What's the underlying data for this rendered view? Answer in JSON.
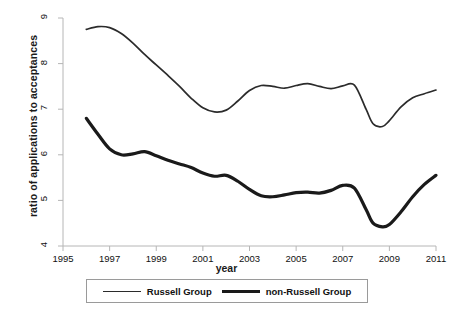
{
  "chart_data": {
    "type": "line",
    "title": "",
    "xlabel": "year",
    "ylabel": "ratio of applications to acceptances",
    "xlim": [
      1995,
      2011
    ],
    "ylim": [
      4,
      9
    ],
    "xticks": [
      "1995",
      "1997",
      "1999",
      "2001",
      "2003",
      "2005",
      "2007",
      "2009",
      "2011"
    ],
    "yticks": [
      "4",
      "5",
      "6",
      "7",
      "8",
      "9"
    ],
    "grid": false,
    "legend_position": "bottom-center",
    "series": [
      {
        "name": "Russell Group",
        "color": "#2b2b2b",
        "line_width": 1.7,
        "x": [
          1996.0,
          1996.5,
          1997.0,
          1997.5,
          1998.0,
          1998.5,
          1999.0,
          1999.5,
          2000.0,
          2000.5,
          2001.0,
          2001.5,
          2002.0,
          2002.5,
          2003.0,
          2003.5,
          2004.0,
          2004.5,
          2005.0,
          2005.5,
          2006.0,
          2006.5,
          2007.0,
          2007.5,
          2008.0,
          2008.3,
          2008.7,
          2009.0,
          2009.5,
          2010.0,
          2010.5,
          2011.0
        ],
        "y": [
          8.75,
          8.81,
          8.79,
          8.66,
          8.45,
          8.2,
          7.97,
          7.74,
          7.5,
          7.24,
          7.03,
          6.94,
          6.98,
          7.18,
          7.41,
          7.52,
          7.5,
          7.46,
          7.52,
          7.56,
          7.5,
          7.45,
          7.51,
          7.53,
          7.0,
          6.68,
          6.62,
          6.75,
          7.05,
          7.25,
          7.34,
          7.42
        ]
      },
      {
        "name": "non-Russell Group",
        "color": "#1a1a1a",
        "line_width": 3.2,
        "x": [
          1996.0,
          1996.5,
          1997.0,
          1997.5,
          1998.0,
          1998.5,
          1999.0,
          1999.5,
          2000.0,
          2000.5,
          2001.0,
          2001.5,
          2002.0,
          2002.5,
          2003.0,
          2003.5,
          2004.0,
          2004.5,
          2005.0,
          2005.5,
          2006.0,
          2006.5,
          2007.0,
          2007.5,
          2008.0,
          2008.3,
          2008.7,
          2009.0,
          2009.5,
          2010.0,
          2010.5,
          2011.0
        ],
        "y": [
          6.8,
          6.45,
          6.13,
          6.0,
          6.02,
          6.07,
          5.98,
          5.88,
          5.8,
          5.72,
          5.6,
          5.53,
          5.55,
          5.42,
          5.24,
          5.1,
          5.08,
          5.12,
          5.17,
          5.18,
          5.16,
          5.22,
          5.33,
          5.27,
          4.8,
          4.5,
          4.42,
          4.47,
          4.75,
          5.08,
          5.35,
          5.55
        ]
      }
    ]
  },
  "legend": {
    "entries": [
      {
        "label": "Russell Group"
      },
      {
        "label": "non-Russell Group"
      }
    ]
  }
}
